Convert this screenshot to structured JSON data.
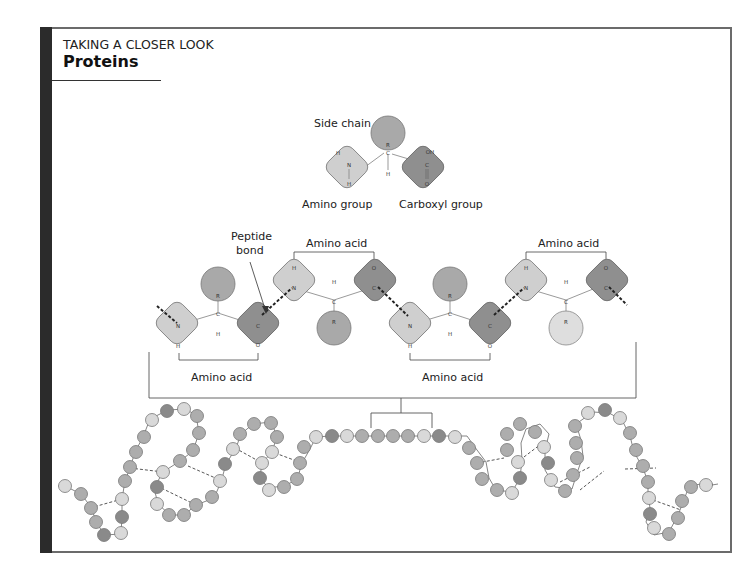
{
  "header": {
    "kicker": "TAKING A CLOSER LOOK",
    "title": "Proteins"
  },
  "single_amino_acid": {
    "side_chain_label": "Side chain",
    "amino_group_label": "Amino group",
    "carboxyl_group_label": "Carboxyl group",
    "atoms": {
      "R": "R",
      "C": "C",
      "H": "H",
      "N": "N",
      "OH": "OH",
      "O": "O"
    }
  },
  "peptide_chain": {
    "peptide_bond_label": "Peptide bond",
    "amino_acid_label": "Amino acid",
    "brackets": [
      {
        "label": "Amino acid",
        "position": "bottom-left"
      },
      {
        "label": "Amino acid",
        "position": "top-center"
      },
      {
        "label": "Amino acid",
        "position": "bottom-center"
      },
      {
        "label": "Amino acid",
        "position": "top-right"
      }
    ]
  },
  "colors": {
    "amino_group_fill": "#cfcfcf",
    "carboxyl_group_fill": "#8f8f8f",
    "side_chain_fill": "#a9a9a9",
    "side_chain_light_fill": "#dedede",
    "bead_dark": "#8a8a8a",
    "bead_mid": "#adadad",
    "bead_light": "#d9d9d9",
    "frame": "#6b6b6b",
    "accent_bar": "#2b2b2b"
  }
}
